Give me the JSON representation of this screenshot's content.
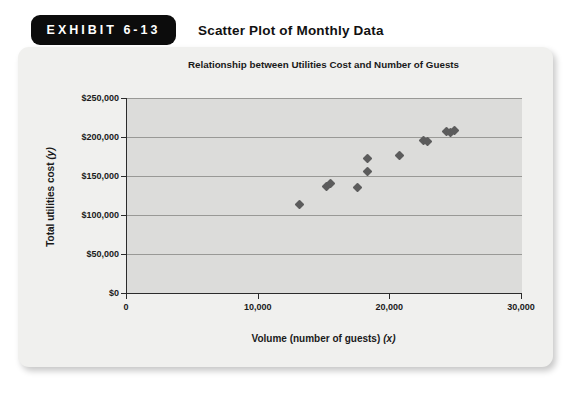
{
  "exhibit": {
    "badge_label": "EXHIBIT 6-13",
    "title": "Scatter Plot of Monthly Data"
  },
  "chart_data": {
    "type": "scatter",
    "title": "Relationship between Utilities Cost and Number of Guests",
    "xlabel": "Volume (number of guests)",
    "xlabel_var": "(x)",
    "ylabel": "Total utilities cost",
    "ylabel_var": "(y)",
    "xlim": [
      0,
      30000
    ],
    "ylim": [
      0,
      250000
    ],
    "x_ticks": [
      {
        "value": 0,
        "label": "0"
      },
      {
        "value": 10000,
        "label": "10,000"
      },
      {
        "value": 20000,
        "label": "20,000"
      },
      {
        "value": 30000,
        "label": "30,000"
      }
    ],
    "y_ticks": [
      {
        "value": 0,
        "label": "$0"
      },
      {
        "value": 50000,
        "label": "$50,000"
      },
      {
        "value": 100000,
        "label": "$100,000"
      },
      {
        "value": 150000,
        "label": "$150,000"
      },
      {
        "value": 200000,
        "label": "$200,000"
      },
      {
        "value": 250000,
        "label": "$250,000"
      }
    ],
    "grid": "horizontal-only",
    "legend_position": "none",
    "marker_shape": "diamond",
    "points": [
      {
        "x": 13100,
        "y": 113000
      },
      {
        "x": 15150,
        "y": 137000
      },
      {
        "x": 15450,
        "y": 141000
      },
      {
        "x": 17500,
        "y": 135000
      },
      {
        "x": 18250,
        "y": 156000
      },
      {
        "x": 18250,
        "y": 173000
      },
      {
        "x": 20700,
        "y": 176000
      },
      {
        "x": 22500,
        "y": 195000
      },
      {
        "x": 22800,
        "y": 194000
      },
      {
        "x": 24300,
        "y": 207000
      },
      {
        "x": 24600,
        "y": 206000
      },
      {
        "x": 24900,
        "y": 208000
      }
    ]
  },
  "colors": {
    "badge_background": "#0c0c0c",
    "badge_text": "#ffffff",
    "card_background": "#f0f0ee",
    "plot_background": "#dcdcda",
    "gridline": "#999996",
    "axis": "#2b2b2b",
    "marker": "#5c5c5c",
    "text": "#1a1a1a"
  }
}
